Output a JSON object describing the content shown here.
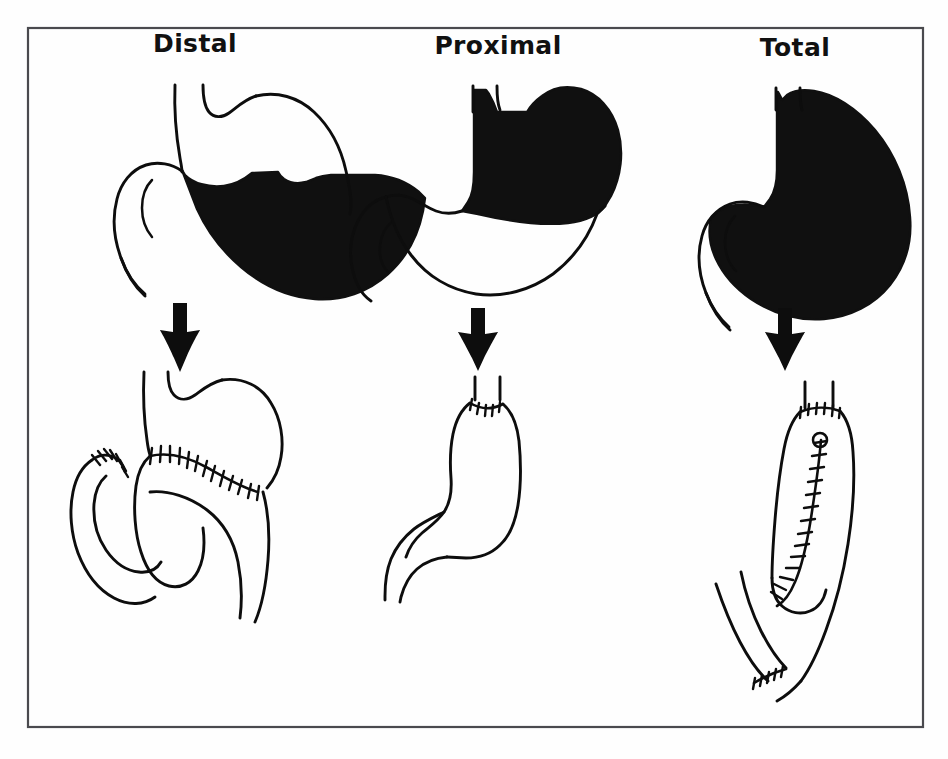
{
  "figure": {
    "background_color": "#fefefe",
    "frame_color": "#4a4a4e",
    "ink_color": "#0d0d0d",
    "shaded_fill_color": "#101010",
    "frame": {
      "x": 28,
      "y": 28,
      "width": 895,
      "height": 699
    }
  },
  "panels": [
    {
      "key": "distal",
      "label": "Distal",
      "label_x": 195,
      "label_y": 52,
      "resection_description": "Distal gastrectomy: antrum and distal body shaded for removal",
      "reconstruction_description": "Gastrojejunostomy with closed duodenal stump (Billroth II)"
    },
    {
      "key": "proximal",
      "label": "Proximal",
      "label_x": 498,
      "label_y": 54,
      "resection_description": "Proximal gastrectomy: cardia, fundus and proximal body shaded for removal",
      "reconstruction_description": "Esophagogastrostomy to the remaining distal stomach"
    },
    {
      "key": "total",
      "label": "Total",
      "label_x": 795,
      "label_y": 56,
      "resection_description": "Total gastrectomy: entire stomach shaded for removal",
      "reconstruction_description": "Roux-en-Y esophagojejunostomy with jejunojejunostomy"
    }
  ],
  "arrows": [
    {
      "key": "distal-arrow",
      "x": 180,
      "y": 300
    },
    {
      "key": "proximal-arrow",
      "x": 478,
      "y": 305
    },
    {
      "key": "total-arrow",
      "x": 785,
      "y": 305
    }
  ],
  "caption": {
    "cropped_text": ""
  }
}
